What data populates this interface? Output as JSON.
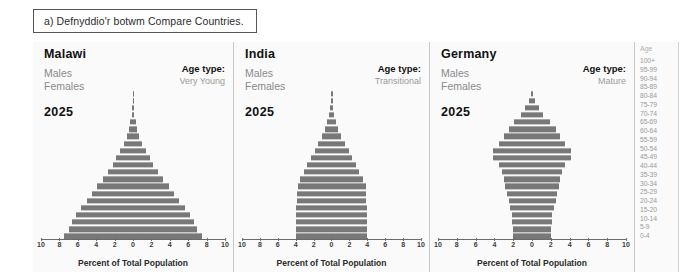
{
  "caption": {
    "text": "a) Defnyddio'r botwm Compare Countries."
  },
  "labels": {
    "males": "Males",
    "females": "Females",
    "age_type_label": "Age type:",
    "axis_title": "Percent of Total Population",
    "age_header": "Age"
  },
  "colors": {
    "bar": "#787878",
    "panel_background": "#fafafa",
    "page_background": "#ffffff",
    "title_text": "#111111",
    "muted_text": "#9a9a9a"
  },
  "age_groups": [
    "100+",
    "95-99",
    "90-94",
    "85-89",
    "80-84",
    "75-79",
    "70-74",
    "65-69",
    "60-64",
    "55-59",
    "50-54",
    "45-49",
    "40-44",
    "35-39",
    "30-34",
    "25-29",
    "20-24",
    "15-20",
    "10-14",
    "5-9",
    "0-4"
  ],
  "axis": {
    "ticks": [
      10,
      8,
      6,
      4,
      2,
      0,
      2,
      4,
      6,
      8,
      10
    ],
    "min": -10,
    "max": 10
  },
  "panels": [
    {
      "country": "Malawi",
      "year": "2025",
      "age_type": "Very Young"
    },
    {
      "country": "India",
      "year": "2025",
      "age_type": "Transitional"
    },
    {
      "country": "Germany",
      "year": "2025",
      "age_type": "Mature"
    }
  ],
  "chart_data": {
    "type": "bar",
    "subtype": "population-pyramid",
    "xlabel": "Percent of Total Population",
    "ylabel": "Age",
    "xlim": [
      -10,
      10
    ],
    "xticks": [
      10,
      8,
      6,
      4,
      2,
      0,
      2,
      4,
      6,
      8,
      10
    ],
    "grid": false,
    "legend": [
      "Males",
      "Females"
    ],
    "legend_position": "top-left",
    "categories": [
      "0-4",
      "5-9",
      "10-14",
      "15-20",
      "20-24",
      "25-29",
      "30-34",
      "35-39",
      "40-44",
      "45-49",
      "50-54",
      "55-59",
      "60-64",
      "65-69",
      "70-74",
      "75-79",
      "80-84",
      "85-89",
      "90-94",
      "95-99",
      "100+"
    ],
    "panels": [
      {
        "name": "Malawi",
        "year": 2025,
        "age_type": "Very Young",
        "series": [
          {
            "name": "Males",
            "values": [
              7.5,
              7.0,
              6.6,
              6.2,
              5.6,
              5.0,
              4.5,
              3.9,
              3.3,
              2.7,
              2.2,
              1.8,
              1.4,
              1.0,
              0.7,
              0.45,
              0.28,
              0.15,
              0.07,
              0.03,
              0.01
            ]
          },
          {
            "name": "Females",
            "values": [
              7.5,
              7.0,
              6.6,
              6.2,
              5.6,
              5.0,
              4.5,
              3.9,
              3.3,
              2.7,
              2.2,
              1.8,
              1.4,
              1.0,
              0.7,
              0.45,
              0.28,
              0.15,
              0.07,
              0.03,
              0.01
            ]
          }
        ]
      },
      {
        "name": "India",
        "year": 2025,
        "age_type": "Transitional",
        "series": [
          {
            "name": "Males",
            "values": [
              4.0,
              4.0,
              4.0,
              4.0,
              4.0,
              3.9,
              3.9,
              3.8,
              3.5,
              3.1,
              2.7,
              2.3,
              1.9,
              1.5,
              1.1,
              0.75,
              0.45,
              0.25,
              0.12,
              0.05,
              0.02
            ]
          },
          {
            "name": "Females",
            "values": [
              4.0,
              4.0,
              4.0,
              4.0,
              4.0,
              3.9,
              3.9,
              3.8,
              3.5,
              3.1,
              2.7,
              2.3,
              1.9,
              1.5,
              1.1,
              0.75,
              0.45,
              0.25,
              0.12,
              0.05,
              0.02
            ]
          }
        ]
      },
      {
        "name": "Germany",
        "year": 2025,
        "age_type": "Mature",
        "series": [
          {
            "name": "Males",
            "values": [
              2.0,
              2.0,
              2.1,
              2.1,
              2.3,
              2.5,
              2.7,
              2.9,
              3.0,
              3.2,
              3.5,
              4.1,
              4.1,
              3.5,
              3.0,
              2.5,
              1.9,
              1.2,
              0.7,
              0.3,
              0.08
            ]
          },
          {
            "name": "Females",
            "values": [
              2.0,
              2.0,
              2.1,
              2.1,
              2.3,
              2.5,
              2.7,
              2.9,
              3.0,
              3.2,
              3.5,
              4.1,
              4.1,
              3.5,
              3.0,
              2.5,
              1.9,
              1.2,
              0.7,
              0.3,
              0.08
            ]
          }
        ]
      }
    ]
  }
}
